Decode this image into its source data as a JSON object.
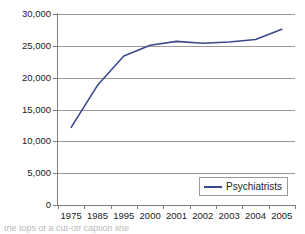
{
  "chart_data": {
    "type": "line",
    "title": "",
    "subtitle": "",
    "xlabel": "",
    "ylabel": "",
    "categories": [
      "1975",
      "1985",
      "1995",
      "2000",
      "2001",
      "2002",
      "2003",
      "2004",
      "2005"
    ],
    "series": [
      {
        "name": "Psychiatrists",
        "color": "#3b4a8c",
        "values": [
          12200,
          18800,
          23400,
          25100,
          25700,
          25400,
          25600,
          26000,
          27600
        ]
      }
    ],
    "ylim": [
      0,
      30000
    ],
    "ytick_values": [
      30000,
      25000,
      20000,
      15000,
      10000,
      5000,
      0
    ],
    "ytick_labels": [
      "30,000",
      "25,000",
      "20,000",
      "15,000",
      "10,000",
      "5,000",
      "0"
    ],
    "grid": true,
    "grid_axis": "y",
    "legend_position": "bottom-right",
    "legend_entries": [
      "Psychiatrists"
    ]
  },
  "axes": {
    "y": {
      "labels": [
        "30,000",
        "25,000",
        "20,000",
        "15,000",
        "10,000",
        "5,000",
        "0"
      ]
    },
    "x": {
      "labels": [
        "1975",
        "1985",
        "1995",
        "2000",
        "2001",
        "2002",
        "2003",
        "2004",
        "2005"
      ]
    }
  },
  "legend": {
    "label": "Psychiatrists"
  },
  "colors": {
    "series_line": "#3b4a8c",
    "gridline": "#9a9a9a",
    "axis": "#7d7d7d",
    "text": "#1b1b1b",
    "background": "#ffffff",
    "legend_border": "#9b9b9b"
  },
  "caption": {
    "clipped_text": "the tops of a cut-off caption line"
  }
}
